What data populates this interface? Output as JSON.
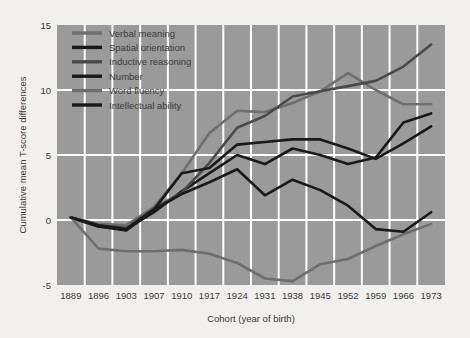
{
  "chart_data": {
    "type": "line",
    "title": "",
    "xlabel": "Cohort (year of birth)",
    "ylabel": "Cumulative mean T-score differences",
    "categories": [
      "1889",
      "1896",
      "1903",
      "1907",
      "1910",
      "1917",
      "1924",
      "1931",
      "1938",
      "1945",
      "1952",
      "1959",
      "1966",
      "1973"
    ],
    "ylim": [
      -5,
      15
    ],
    "yticks": [
      "-5",
      "0",
      "5",
      "10",
      "15"
    ],
    "ytick_values": [
      -5,
      0,
      5,
      10,
      15
    ],
    "grid": true,
    "legend_position": "top-left",
    "plot_background": "#9a9a9a",
    "gridline_color": "#ffffff",
    "series": [
      {
        "name": "Verbal meaning",
        "color": "#6e6e6e",
        "values": [
          0.2,
          -0.3,
          -0.4,
          1.0,
          3.6,
          6.7,
          8.4,
          8.3,
          9.0,
          9.9,
          11.3,
          10.0,
          8.9,
          8.9
        ]
      },
      {
        "name": "Spatial orientation",
        "color": "#1a1a1a",
        "values": [
          0.2,
          -0.5,
          -0.7,
          0.6,
          2.2,
          3.6,
          5.0,
          4.3,
          5.5,
          5.0,
          4.3,
          4.8,
          7.5,
          8.2
        ]
      },
      {
        "name": "Inductive reasoning",
        "color": "#4a4a4a",
        "values": [
          0.2,
          -0.4,
          -0.6,
          0.9,
          2.1,
          4.4,
          7.1,
          8.0,
          9.5,
          9.9,
          10.3,
          10.7,
          11.8,
          13.5
        ]
      },
      {
        "name": "Number",
        "color": "#1a1a1a",
        "values": [
          0.2,
          -0.5,
          -0.8,
          0.8,
          3.6,
          4.0,
          5.8,
          6.0,
          6.2,
          6.2,
          5.5,
          4.7,
          5.9,
          7.2
        ]
      },
      {
        "name": "Word fluency",
        "color": "#6e6e6e",
        "values": [
          0.2,
          -2.2,
          -2.4,
          -2.4,
          -2.3,
          -2.6,
          -3.3,
          -4.5,
          -4.7,
          -3.4,
          -3.0,
          -2.0,
          -1.1,
          -0.3
        ]
      },
      {
        "name": "Intellectual ability",
        "color": "#1a1a1a",
        "values": [
          0.2,
          -0.4,
          -0.7,
          0.8,
          2.0,
          2.9,
          3.9,
          1.9,
          3.1,
          2.3,
          1.1,
          -0.7,
          -0.9,
          0.6
        ]
      }
    ]
  },
  "legend": {
    "items": [
      {
        "label": "Verbal meaning",
        "color": "#6e6e6e"
      },
      {
        "label": "Spatial orientation",
        "color": "#1a1a1a"
      },
      {
        "label": "Inductive reasoning",
        "color": "#4a4a4a"
      },
      {
        "label": "Number",
        "color": "#1a1a1a"
      },
      {
        "label": "Word fluency",
        "color": "#6e6e6e"
      },
      {
        "label": "Intellectual ability",
        "color": "#1a1a1a"
      }
    ]
  },
  "axes": {
    "x_title": "Cohort (year of birth)",
    "y_title": "Cumulative mean T-score differences"
  }
}
